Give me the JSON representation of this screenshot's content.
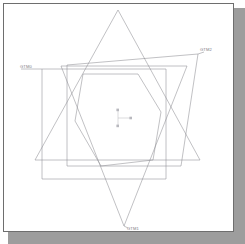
{
  "viewport": {
    "name": "cad-geometry-viewport",
    "background_color": "#ffffff",
    "frame_color": "#6e6e6e",
    "shadow_color": "#9d9d9d",
    "wire_color": "#8d8d93"
  },
  "labels": [
    {
      "id": "gtm0",
      "text": "GTM0",
      "x": 20,
      "y": 69,
      "anchor": "start"
    },
    {
      "id": "gtm2",
      "text": "GTM2",
      "x": 198,
      "y": 54,
      "anchor": "start"
    },
    {
      "id": "gtm1",
      "text": "GTM1",
      "x": 119,
      "y": 228,
      "anchor": "start"
    }
  ],
  "axis_marker": {
    "name": "origin-triad",
    "origin_x": 118,
    "origin_y": 117,
    "x_axis_label": "",
    "y_axis_label": "",
    "z_axis_label": "",
    "node_color": "#b8b8be"
  },
  "shapes": [
    {
      "id": "triangle-up",
      "type": "triangle",
      "label_ref": "gtm2",
      "points": "117,10 200,160 34,160"
    },
    {
      "id": "triangle-down",
      "type": "triangle",
      "label_ref": "gtm1",
      "points": "60,66 186,66 123,226"
    },
    {
      "id": "quad-upper",
      "type": "quadrilateral",
      "label_ref": "gtm2",
      "points": "66,65 197,54 180,166 66,166"
    },
    {
      "id": "quad-lower",
      "type": "quadrilateral",
      "label_ref": "gtm0",
      "points": "41,69 165,69 165,179 41,179"
    },
    {
      "id": "hexagon-inner",
      "type": "hexagon",
      "points": "82,74 137,74 160,112 152,160 100,166 74,121"
    }
  ]
}
